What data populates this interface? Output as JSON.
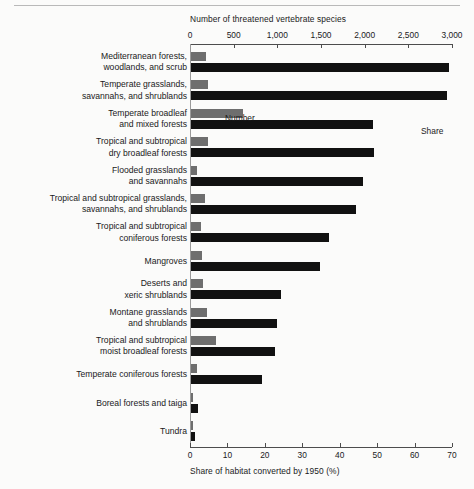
{
  "chart_data": {
    "type": "bar",
    "orientation": "horizontal",
    "title": "",
    "top_axis": {
      "label": "Number of threatened vertebrate species",
      "ticks": [
        0,
        500,
        1000,
        1500,
        2000,
        2500,
        3000
      ],
      "tick_labels": [
        "0",
        "500",
        "1,000",
        "1,500",
        "2,000",
        "2,500",
        "3,000"
      ],
      "range": [
        0,
        3000
      ],
      "position": "top"
    },
    "bottom_axis": {
      "label": "Share of habitat converted by 1950 (%)",
      "ticks": [
        0,
        10,
        20,
        30,
        40,
        50,
        60,
        70
      ],
      "tick_labels": [
        "0",
        "10",
        "20",
        "30",
        "40",
        "50",
        "60",
        "70"
      ],
      "range": [
        0,
        70
      ],
      "position": "bottom"
    },
    "legend": [
      {
        "name": "Number",
        "color": "#6e6e6e",
        "axis": "top"
      },
      {
        "name": "Share",
        "color": "#111111",
        "axis": "bottom"
      }
    ],
    "grid": false,
    "categories": [
      "Mediterranean forests, woodlands, and scrub",
      "Temperate grasslands, savannahs, and shrublands",
      "Temperate broadleaf and mixed forests",
      "Tropical and subtropical dry broadleaf forests",
      "Flooded grasslands and savannahs",
      "Tropical and subtropical grasslands, savannahs, and shrublands",
      "Tropical and subtropical coniferous forests",
      "Mangroves",
      "Deserts and xeric shrublands",
      "Montane grasslands and shrublands",
      "Tropical and subtropical moist broadleaf forests",
      "Temperate coniferous forests",
      "Boreal forests and taiga",
      "Tundra"
    ],
    "series": [
      {
        "name": "Number",
        "axis": "top",
        "color": "#6e6e6e",
        "values": [
          170,
          190,
          600,
          190,
          70,
          155,
          120,
          130,
          140,
          185,
          290,
          65,
          15,
          8
        ]
      },
      {
        "name": "Share",
        "axis": "bottom",
        "color": "#111111",
        "values": [
          69,
          68.5,
          48.5,
          49,
          46,
          44,
          37,
          34.5,
          24,
          23,
          22.5,
          19,
          2,
          1
        ]
      }
    ]
  },
  "rows": [
    {
      "line1": "Mediterranean forests,",
      "line2": "woodlands, and scrub"
    },
    {
      "line1": "Temperate grasslands,",
      "line2": "savannahs, and shrublands"
    },
    {
      "line1": "Temperate broadleaf",
      "line2": "and mixed forests"
    },
    {
      "line1": "Tropical and subtropical",
      "line2": "dry broadleaf forests"
    },
    {
      "line1": "Flooded grasslands",
      "line2": "and savannahs"
    },
    {
      "line1": "Tropical and subtropical grasslands,",
      "line2": "savannahs, and shrublands"
    },
    {
      "line1": "Tropical and subtropical",
      "line2": "coniferous forests"
    },
    {
      "line1": "Mangroves",
      "line2": ""
    },
    {
      "line1": "Deserts and",
      "line2": "xeric shrublands"
    },
    {
      "line1": "Montane grasslands",
      "line2": "and shrublands"
    },
    {
      "line1": "Tropical and subtropical",
      "line2": "moist broadleaf forests"
    },
    {
      "line1": "Temperate coniferous forests",
      "line2": ""
    },
    {
      "line1": "Boreal forests and taiga",
      "line2": ""
    },
    {
      "line1": "Tundra",
      "line2": ""
    }
  ]
}
